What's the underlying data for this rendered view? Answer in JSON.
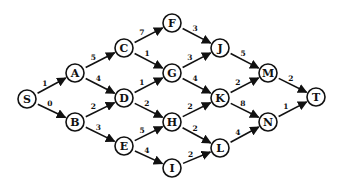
{
  "diagram": {
    "type": "directed-weighted-graph",
    "source": "S",
    "sink": "T",
    "nodes": [
      {
        "id": "S",
        "label": "S",
        "x": 27,
        "y": 99
      },
      {
        "id": "A",
        "label": "A",
        "x": 75,
        "y": 73
      },
      {
        "id": "B",
        "label": "B",
        "x": 75,
        "y": 122
      },
      {
        "id": "C",
        "label": "C",
        "x": 124,
        "y": 48
      },
      {
        "id": "D",
        "label": "D",
        "x": 124,
        "y": 98
      },
      {
        "id": "E",
        "label": "E",
        "x": 124,
        "y": 146
      },
      {
        "id": "F",
        "label": "F",
        "x": 172,
        "y": 23
      },
      {
        "id": "G",
        "label": "G",
        "x": 172,
        "y": 73
      },
      {
        "id": "H",
        "label": "H",
        "x": 172,
        "y": 122
      },
      {
        "id": "I",
        "label": "I",
        "x": 172,
        "y": 168
      },
      {
        "id": "J",
        "label": "J",
        "x": 220,
        "y": 48
      },
      {
        "id": "K",
        "label": "K",
        "x": 220,
        "y": 98
      },
      {
        "id": "L",
        "label": "L",
        "x": 220,
        "y": 148
      },
      {
        "id": "M",
        "label": "M",
        "x": 268,
        "y": 73
      },
      {
        "id": "N",
        "label": "N",
        "x": 268,
        "y": 122
      },
      {
        "id": "T",
        "label": "T",
        "x": 316,
        "y": 97
      }
    ],
    "edges": [
      {
        "from": "S",
        "to": "A",
        "weight": "1"
      },
      {
        "from": "S",
        "to": "B",
        "weight": "0"
      },
      {
        "from": "A",
        "to": "C",
        "weight": "5"
      },
      {
        "from": "A",
        "to": "D",
        "weight": "4"
      },
      {
        "from": "B",
        "to": "D",
        "weight": "2"
      },
      {
        "from": "B",
        "to": "E",
        "weight": "3"
      },
      {
        "from": "C",
        "to": "F",
        "weight": "7"
      },
      {
        "from": "C",
        "to": "G",
        "weight": "1"
      },
      {
        "from": "D",
        "to": "G",
        "weight": "1"
      },
      {
        "from": "D",
        "to": "H",
        "weight": "2"
      },
      {
        "from": "E",
        "to": "H",
        "weight": "5"
      },
      {
        "from": "E",
        "to": "I",
        "weight": "4"
      },
      {
        "from": "F",
        "to": "J",
        "weight": "3"
      },
      {
        "from": "G",
        "to": "J",
        "weight": "3"
      },
      {
        "from": "G",
        "to": "K",
        "weight": "4"
      },
      {
        "from": "H",
        "to": "K",
        "weight": "2"
      },
      {
        "from": "H",
        "to": "L",
        "weight": "2"
      },
      {
        "from": "I",
        "to": "L",
        "weight": "2"
      },
      {
        "from": "J",
        "to": "M",
        "weight": "5"
      },
      {
        "from": "K",
        "to": "M",
        "weight": "2"
      },
      {
        "from": "K",
        "to": "N",
        "weight": "8"
      },
      {
        "from": "L",
        "to": "N",
        "weight": "4"
      },
      {
        "from": "M",
        "to": "T",
        "weight": "2"
      },
      {
        "from": "N",
        "to": "T",
        "weight": "1"
      }
    ],
    "style": {
      "stroke_color": "#111111",
      "background": "#ffffff",
      "node_radius": 9
    }
  }
}
